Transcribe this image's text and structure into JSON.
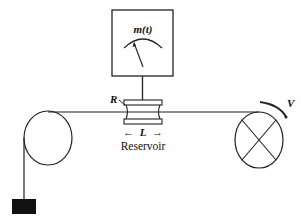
{
  "diagram": {
    "meter": {
      "label": "m(t)"
    },
    "reservoir": {
      "label": "Reservoir",
      "length_label": "L",
      "radius_label": "R"
    },
    "velocity_label": "V",
    "arrow_left": "←",
    "arrow_right": "→",
    "colors": {
      "ink": "#222222",
      "weight": "#111111",
      "background": "#ffffff"
    }
  }
}
